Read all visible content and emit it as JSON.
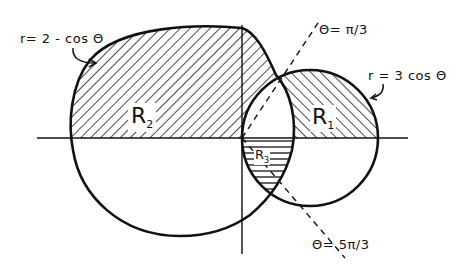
{
  "diagram": {
    "curves": [
      {
        "id": "limacon",
        "label": "r= 2 - cos Θ"
      },
      {
        "id": "circle",
        "label": "r = 3 cos Θ"
      }
    ],
    "rays": [
      {
        "id": "ray-pi-3",
        "label": "Θ= π/3"
      },
      {
        "id": "ray-5pi-3",
        "label": "Θ= 5π/3"
      }
    ],
    "regions": [
      {
        "id": "R2",
        "letter": "R",
        "sub": "2"
      },
      {
        "id": "R1",
        "letter": "R",
        "sub": "1"
      },
      {
        "id": "R3",
        "letter": "R",
        "sub": "3"
      }
    ],
    "colors": {
      "stroke": "#111111",
      "hatch": "#222222",
      "background": "#ffffff"
    }
  }
}
